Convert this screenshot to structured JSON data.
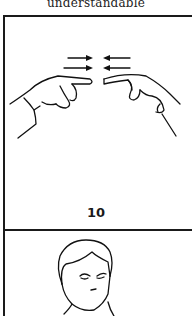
{
  "caption": {
    "text": "understandable"
  },
  "sign_panel": {
    "number": "10",
    "illustration": "two-index-fingers-moving-together-icon",
    "arrows": "inward-arrows-icon"
  },
  "next_panel": {
    "illustration": "person-face-portrait-icon"
  },
  "colors": {
    "ink": "#1a1a1a",
    "paper": "#ffffff"
  }
}
